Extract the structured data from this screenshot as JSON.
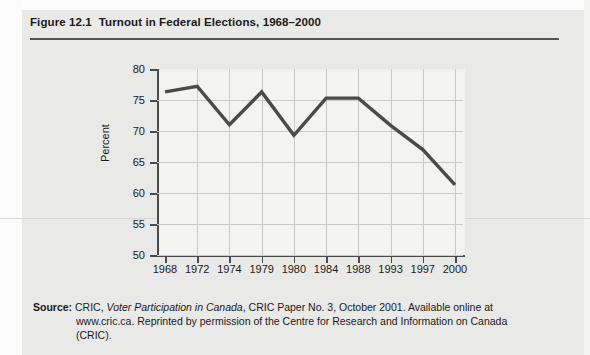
{
  "figure": {
    "number": "Figure 12.1",
    "title": "Turnout in Federal Elections, 1968–2000"
  },
  "chart_data": {
    "type": "line",
    "title": "Turnout in Federal Elections, 1968–2000",
    "xlabel": "",
    "ylabel": "Percent",
    "categories": [
      "1968",
      "1972",
      "1974",
      "1979",
      "1980",
      "1984",
      "1988",
      "1993",
      "1997",
      "2000"
    ],
    "values": [
      76.3,
      77.2,
      71.0,
      76.3,
      69.3,
      75.3,
      75.3,
      70.9,
      67.0,
      61.3
    ],
    "ylim": [
      50,
      80
    ],
    "yticks": [
      "50",
      "55",
      "60",
      "65",
      "70",
      "75",
      "80"
    ],
    "grid": true,
    "legend": "none",
    "line_color": "#4a4a48"
  },
  "source": {
    "label": "Source:",
    "part1": "CRIC, ",
    "italic_title": "Voter Participation in Canada",
    "part2": ", CRIC Paper No. 3, October 2001. Available online at www.cric.ca. Reprinted by permission of the Centre for Research and Information on Canada (CRIC)."
  },
  "colors": {
    "page_background": "#e9e9e7",
    "plot_background": "#f3f3f1",
    "axis": "#4a4a48",
    "gridline": "#c9c9c6",
    "text": "#1a1a1a"
  }
}
